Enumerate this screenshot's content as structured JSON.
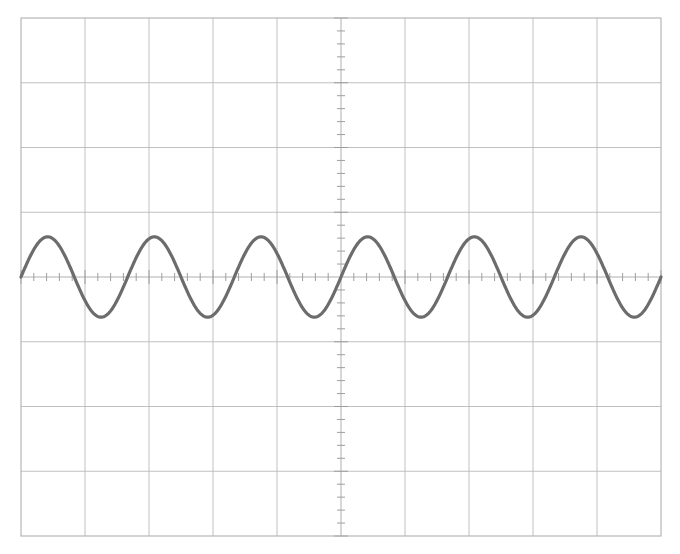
{
  "display": {
    "title": "Oscilloscope Waveform Display",
    "width": 680,
    "height": 554,
    "background_color": "#ffffff"
  },
  "graticule": {
    "x0": 21,
    "y0": 18,
    "x1": 661,
    "y1": 536,
    "divisions_x": 10,
    "divisions_y": 8,
    "div_px_x": 64.0,
    "div_px_y": 64.75,
    "grid_color": "#b9b9b9",
    "axis_color": "#a6a6a6",
    "border_color": "#b0b0b0",
    "grid_line_width": 0.9,
    "border_line_width": 1.1,
    "subdivisions_per_div": 5,
    "tick_len_major": 7,
    "tick_len_minor": 4,
    "tick_color": "#9a9a9a"
  },
  "chart_data": {
    "type": "line",
    "subtitle": "",
    "xlabel": "",
    "ylabel": "",
    "waveform": "sine",
    "cycles_across_screen": 6.0,
    "amplitude_div": 0.62,
    "offset_div": 0.0,
    "phase_deg": 0.0,
    "xlim": [
      -5,
      5
    ],
    "ylim": [
      -4,
      4
    ],
    "x_unit": "div",
    "y_unit": "div",
    "grid": true,
    "legend": false,
    "trace_color": "#6c6c6c",
    "trace_width": 3.2,
    "samples": 1200,
    "tick_labels_x": [
      "-5",
      "-4",
      "-3",
      "-2",
      "-1",
      "0",
      "1",
      "2",
      "3",
      "4",
      "5"
    ],
    "tick_labels_y": [
      "4",
      "3",
      "2",
      "1",
      "0",
      "-1",
      "-2",
      "-3",
      "-4"
    ],
    "annotations": []
  }
}
